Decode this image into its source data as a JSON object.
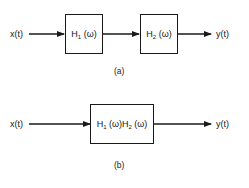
{
  "diagram_a": {
    "input_label": "x(t)",
    "block1": {
      "name": "H",
      "subscript": "1",
      "arg": " (ω)"
    },
    "block2": {
      "name": "H",
      "subscript": "2",
      "arg": " (ω)"
    },
    "output_label": "y(t)",
    "caption": "(a)"
  },
  "diagram_b": {
    "input_label": "x(t)",
    "block": {
      "name1": "H",
      "subscript1": "1",
      "arg1": " (ω)",
      "name2": "H",
      "subscript2": "2",
      "arg2": " (ω)"
    },
    "output_label": "y(t)",
    "caption": "(b)"
  }
}
